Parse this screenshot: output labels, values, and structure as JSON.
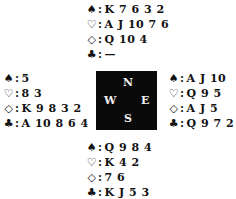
{
  "hands": {
    "north": {
      "spades": "K 7 6 3 2",
      "hearts": "A J 10 7 6",
      "diamonds": "Q 10 4",
      "clubs": "—"
    },
    "west": {
      "spades": "5",
      "hearts": "8 3",
      "diamonds": "K 9 8 3 2",
      "clubs": "A 10 8 6 4"
    },
    "east": {
      "spades": "A J 10",
      "hearts": "Q 9 5",
      "diamonds": "A J 5",
      "clubs": "Q 9 7 2"
    },
    "south": {
      "spades": "Q 9 8 4",
      "hearts": "K 4 2",
      "diamonds": "7 6",
      "clubs": "K J 5 3"
    }
  },
  "symbols": {
    "spades": "♠",
    "hearts": "♡",
    "diamonds": "◇",
    "clubs": "♣",
    "colon": ":"
  },
  "compass": {
    "north": "N",
    "west": "W",
    "east": "E",
    "south": "S",
    "background": "#0a0a0a"
  }
}
